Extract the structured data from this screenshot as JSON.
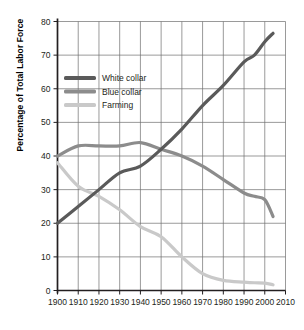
{
  "chart_data": {
    "type": "line",
    "title": "",
    "xlabel": "",
    "ylabel": "Percentage of Total Labor Force",
    "xlim": [
      1900,
      2010
    ],
    "ylim": [
      0,
      80
    ],
    "grid": true,
    "legend_position": "upper-left-inside",
    "xticks": [
      "1900",
      "1910",
      "1920",
      "1930",
      "1940",
      "1950",
      "1960",
      "1970",
      "1980",
      "1990",
      "2000",
      "2010"
    ],
    "yticks": [
      "0",
      "10",
      "20",
      "30",
      "40",
      "50",
      "60",
      "70",
      "80"
    ],
    "x": [
      1900,
      1910,
      1920,
      1930,
      1940,
      1950,
      1960,
      1970,
      1980,
      1990,
      1995,
      2000,
      2004
    ],
    "series": [
      {
        "name": "White collar",
        "color": "#5a5a5a",
        "values": [
          20,
          25,
          30,
          35,
          37,
          42,
          48,
          55,
          61,
          68,
          70,
          74,
          76.5
        ]
      },
      {
        "name": "Blue collar",
        "color": "#8c8c8c",
        "values": [
          40,
          43,
          43,
          43,
          44,
          42,
          40,
          37,
          33,
          29,
          28,
          27,
          22
        ]
      },
      {
        "name": "Farming",
        "color": "#c9c9c9",
        "values": [
          38,
          31,
          28,
          24,
          19,
          16,
          10,
          5,
          3,
          2.5,
          2.3,
          2.2,
          1.7
        ]
      }
    ]
  },
  "legend": {
    "items": [
      {
        "label": "White collar",
        "color": "#5a5a5a"
      },
      {
        "label": "Blue collar",
        "color": "#8c8c8c"
      },
      {
        "label": "Farming",
        "color": "#c9c9c9"
      }
    ]
  },
  "axes": {
    "y_axis_title": "Percentage of Total Labor Force"
  },
  "colors": {
    "grid": "#6f6f6f",
    "axis": "#231f20",
    "background": "#ffffff",
    "white_collar": "#5a5a5a",
    "blue_collar": "#8c8c8c",
    "farming": "#c9c9c9"
  }
}
